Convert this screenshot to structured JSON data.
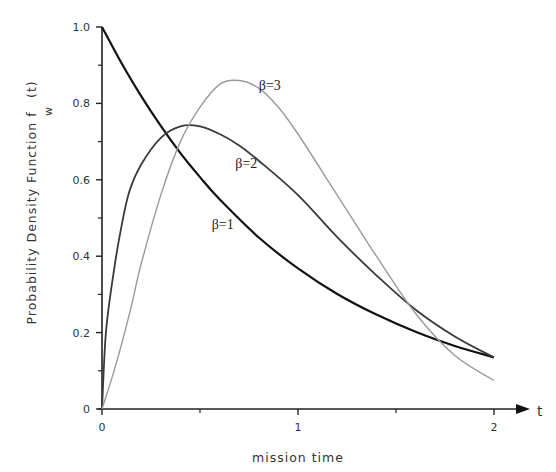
{
  "chart_data": {
    "type": "line",
    "title": "",
    "xlabel": "mission time",
    "x_axis_symbol": "t",
    "ylabel": "Probability Density Function   f",
    "ylabel_subscript": "w",
    "ylabel_suffix": "(t)",
    "xlim": [
      0,
      2
    ],
    "ylim": [
      0,
      1.0
    ],
    "x_ticks": [
      {
        "value": 0,
        "label": "0"
      },
      {
        "value": 1,
        "label": "1"
      },
      {
        "value": 2,
        "label": "2"
      }
    ],
    "x_minor_ticks": [
      0.5,
      1.5
    ],
    "y_ticks": [
      {
        "value": 0,
        "label": "0"
      },
      {
        "value": 0.2,
        "label": "0.2"
      },
      {
        "value": 0.4,
        "label": "0.4"
      },
      {
        "value": 0.6,
        "label": "0.6"
      },
      {
        "value": 0.8,
        "label": "0.8"
      },
      {
        "value": 1.0,
        "label": "1.0"
      }
    ],
    "y_minor_ticks": [
      0.1,
      0.3,
      0.5,
      0.7,
      0.9
    ],
    "grid": false,
    "legend": "inline labels",
    "series": [
      {
        "name": "β=1",
        "color": "#111111",
        "width": 2.2,
        "label_pos": {
          "t": 0.56,
          "f": 0.47
        },
        "x": [
          0,
          0.1,
          0.2,
          0.3,
          0.4,
          0.5,
          0.6,
          0.8,
          1.0,
          1.2,
          1.4,
          1.6,
          1.8,
          2.0
        ],
        "values": [
          1.0,
          0.905,
          0.819,
          0.741,
          0.67,
          0.607,
          0.549,
          0.449,
          0.368,
          0.301,
          0.247,
          0.202,
          0.165,
          0.135
        ]
      },
      {
        "name": "β=2",
        "color": "#3a3a3a",
        "width": 1.8,
        "label_pos": {
          "t": 0.68,
          "f": 0.63
        },
        "x": [
          0,
          0.02,
          0.06,
          0.1,
          0.14,
          0.2,
          0.3,
          0.4,
          0.5,
          0.6,
          0.7,
          0.8,
          1.0,
          1.2,
          1.4,
          1.6,
          1.8,
          2.0
        ],
        "values": [
          0.0,
          0.2,
          0.36,
          0.48,
          0.57,
          0.64,
          0.71,
          0.74,
          0.74,
          0.72,
          0.69,
          0.65,
          0.56,
          0.45,
          0.35,
          0.26,
          0.19,
          0.135
        ]
      },
      {
        "name": "β=3",
        "color": "#9a9a9a",
        "width": 1.4,
        "label_pos": {
          "t": 0.8,
          "f": 0.835
        },
        "x": [
          0,
          0.05,
          0.1,
          0.15,
          0.2,
          0.3,
          0.4,
          0.5,
          0.6,
          0.7,
          0.8,
          0.9,
          1.0,
          1.2,
          1.4,
          1.6,
          1.8,
          2.0
        ],
        "values": [
          0.0,
          0.08,
          0.17,
          0.27,
          0.38,
          0.56,
          0.7,
          0.79,
          0.85,
          0.86,
          0.84,
          0.79,
          0.72,
          0.56,
          0.4,
          0.25,
          0.14,
          0.075
        ]
      }
    ]
  }
}
